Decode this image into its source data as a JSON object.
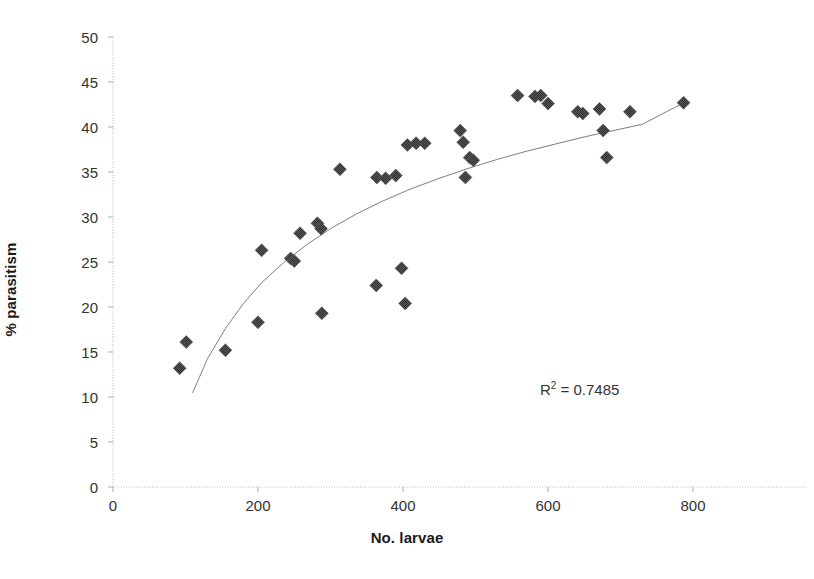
{
  "chart_data": {
    "type": "scatter",
    "title": "",
    "xlabel": "No. larvae",
    "ylabel": "% parasitism",
    "xlim": [
      0,
      800
    ],
    "ylim": [
      0,
      50
    ],
    "xticks": [
      0,
      200,
      400,
      600,
      800
    ],
    "yticks": [
      0,
      5,
      10,
      15,
      20,
      25,
      30,
      35,
      40,
      45,
      50
    ],
    "grid": false,
    "legend": null,
    "marker": {
      "shape": "diamond",
      "color": "#595959",
      "size": 13,
      "pattern": "cross-hatch"
    },
    "annotations": [
      {
        "text": "R² = 0.7485",
        "base": "R",
        "exponent": "2",
        "value": "= 0.7485",
        "x": 590,
        "y": 14.5
      }
    ],
    "trendline": {
      "type": "logarithmic",
      "color": "#7f7f7f",
      "width": 1,
      "r_squared": 0.7485,
      "points": [
        [
          110,
          10.5
        ],
        [
          130,
          14.2
        ],
        [
          155,
          17.6
        ],
        [
          180,
          20.4
        ],
        [
          205,
          22.7
        ],
        [
          235,
          24.9
        ],
        [
          265,
          26.8
        ],
        [
          300,
          28.7
        ],
        [
          335,
          30.3
        ],
        [
          370,
          31.7
        ],
        [
          410,
          33.1
        ],
        [
          450,
          34.3
        ],
        [
          490,
          35.4
        ],
        [
          530,
          36.4
        ],
        [
          570,
          37.3
        ],
        [
          610,
          38.1
        ],
        [
          650,
          38.9
        ],
        [
          690,
          39.6
        ],
        [
          730,
          40.3
        ],
        [
          790,
          42.8
        ]
      ]
    },
    "points": [
      [
        92,
        13.2
      ],
      [
        101,
        16.1
      ],
      [
        155,
        15.2
      ],
      [
        200,
        18.3
      ],
      [
        205,
        26.3
      ],
      [
        245,
        25.4
      ],
      [
        250,
        25.1
      ],
      [
        258,
        28.2
      ],
      [
        282,
        29.3
      ],
      [
        287,
        28.7
      ],
      [
        288,
        19.3
      ],
      [
        313,
        35.3
      ],
      [
        363,
        22.4
      ],
      [
        364,
        34.4
      ],
      [
        376,
        34.3
      ],
      [
        390,
        34.6
      ],
      [
        398,
        24.3
      ],
      [
        403,
        20.4
      ],
      [
        406,
        38.0
      ],
      [
        418,
        38.2
      ],
      [
        430,
        38.2
      ],
      [
        479,
        39.6
      ],
      [
        483,
        38.3
      ],
      [
        486,
        34.4
      ],
      [
        492,
        36.6
      ],
      [
        497,
        36.3
      ],
      [
        558,
        43.5
      ],
      [
        582,
        43.4
      ],
      [
        590,
        43.5
      ],
      [
        600,
        42.6
      ],
      [
        641,
        41.7
      ],
      [
        648,
        41.5
      ],
      [
        671,
        42.0
      ],
      [
        676,
        39.6
      ],
      [
        681,
        36.6
      ],
      [
        713,
        41.7
      ],
      [
        787,
        42.7
      ]
    ]
  }
}
